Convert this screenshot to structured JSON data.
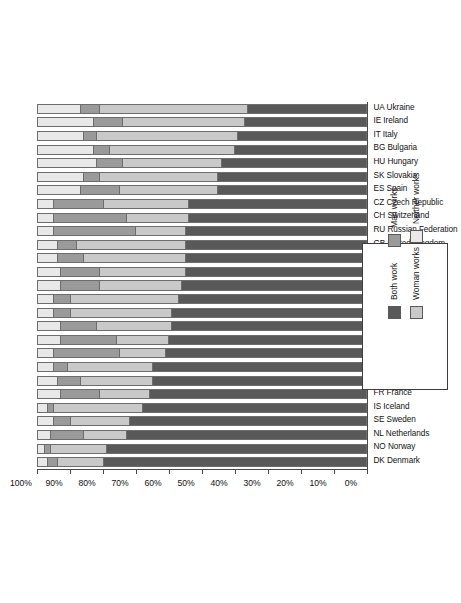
{
  "chart_data": {
    "type": "bar",
    "subtype": "stacked-bar-100-percent",
    "orientation": "rotated-90-ccw",
    "title": "",
    "xlabel": "",
    "ylabel": "",
    "ylim": [
      0,
      100
    ],
    "grid": false,
    "legend_position": "bottom-right",
    "tick_labels": [
      "0%",
      "10%",
      "20%",
      "30%",
      "40%",
      "50%",
      "60%",
      "70%",
      "80%",
      "90%",
      "100%"
    ],
    "tick_values": [
      0,
      10,
      20,
      30,
      40,
      50,
      60,
      70,
      80,
      90,
      100
    ],
    "series": [
      {
        "name": "Both work",
        "color": "#595959",
        "values": [
          80,
          79,
          73,
          72,
          68,
          66,
          65,
          65,
          61,
          60,
          59,
          59,
          57,
          56,
          55,
          55,
          55,
          55,
          54,
          54,
          45,
          45,
          44,
          40,
          39,
          37,
          36
        ]
      },
      {
        "name": "Woman works",
        "color": "#c9c9c9",
        "values": [
          14,
          17,
          13,
          18,
          27,
          15,
          22,
          26,
          14,
          16,
          23,
          31,
          33,
          25,
          26,
          31,
          33,
          15,
          19,
          26,
          30,
          36,
          30,
          38,
          43,
          37,
          45
        ]
      },
      {
        "name": "Man works",
        "color": "#9a9a9a",
        "values": [
          3,
          2,
          10,
          5,
          2,
          12,
          7,
          4,
          20,
          17,
          11,
          5,
          5,
          12,
          12,
          8,
          6,
          25,
          22,
          15,
          12,
          5,
          8,
          5,
          4,
          9,
          6
        ]
      },
      {
        "name": "Neither works",
        "color": "#e8e8e8",
        "values": [
          3,
          2,
          4,
          5,
          3,
          7,
          6,
          5,
          5,
          7,
          7,
          5,
          5,
          7,
          7,
          6,
          6,
          5,
          5,
          5,
          13,
          14,
          18,
          17,
          14,
          17,
          13
        ]
      }
    ],
    "categories": [
      "DK Denmark",
      "NO Norway",
      "NL Netherlands",
      "SE Sweden",
      "IS Iceland",
      "FR France",
      "BE Belgium",
      "FI Finland",
      "LT Lithuania",
      "DE Germany",
      "SI Slovenia",
      "CY Cyprus",
      "PL Poland",
      "EE Estonia",
      "IL Israel",
      "PT Portugal",
      "GB United Kingdom",
      "RU Russian Federation",
      "CH Switzerland",
      "CZ Czech Republic",
      "ES Spain",
      "SK Slovakia",
      "HU Hungary",
      "BG Bulgaria",
      "IT Italy",
      "IE Ireland",
      "UA Ukraine"
    ]
  },
  "legend": {
    "items": [
      {
        "label": "Both work",
        "color": "#595959"
      },
      {
        "label": "Man works",
        "color": "#9a9a9a"
      },
      {
        "label": "Woman works",
        "color": "#c9c9c9"
      },
      {
        "label": "Neither works",
        "color": "#e8e8e8"
      }
    ]
  }
}
